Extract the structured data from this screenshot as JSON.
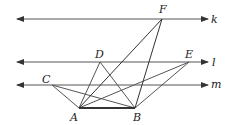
{
  "diagram": {
    "lines": [
      {
        "name": "k",
        "label": "k",
        "y": 19
      },
      {
        "name": "l",
        "label": "l",
        "y": 62
      },
      {
        "name": "m",
        "label": "m",
        "y": 85
      }
    ],
    "points": {
      "A": {
        "label": "A",
        "x": 79,
        "y": 108
      },
      "B": {
        "label": "B",
        "x": 135,
        "y": 108
      },
      "C": {
        "label": "C",
        "x": 52,
        "y": 85
      },
      "D": {
        "label": "D",
        "x": 100,
        "y": 62
      },
      "E": {
        "label": "E",
        "x": 189,
        "y": 62
      },
      "F": {
        "label": "F",
        "x": 162,
        "y": 19
      }
    },
    "segments": [
      [
        "A",
        "B"
      ],
      [
        "A",
        "C"
      ],
      [
        "B",
        "C"
      ],
      [
        "A",
        "D"
      ],
      [
        "B",
        "D"
      ],
      [
        "A",
        "E"
      ],
      [
        "B",
        "E"
      ],
      [
        "A",
        "F"
      ],
      [
        "B",
        "F"
      ]
    ],
    "colors": {
      "line": "#555555",
      "text": "#222222"
    }
  }
}
